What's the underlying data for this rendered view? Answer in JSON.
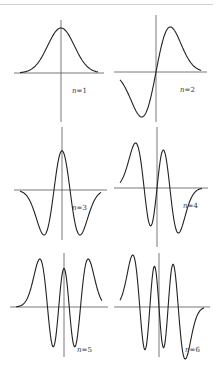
{
  "figure": {
    "stroke_color": "#222222",
    "axis_color": "#555555"
  },
  "chart_data": [
    {
      "type": "line",
      "label": "n = 1",
      "n": 1,
      "nodes": 0,
      "parity": "even",
      "panel": "top-left"
    },
    {
      "type": "line",
      "label": "n = 2",
      "n": 2,
      "nodes": 1,
      "parity": "odd",
      "panel": "top-right"
    },
    {
      "type": "line",
      "label": "n = 3",
      "n": 3,
      "nodes": 2,
      "parity": "even",
      "panel": "middle-left"
    },
    {
      "type": "line",
      "label": "n = 4",
      "n": 4,
      "nodes": 3,
      "parity": "odd",
      "panel": "middle-right"
    },
    {
      "type": "line",
      "label": "n = 5",
      "n": 5,
      "nodes": 4,
      "parity": "even",
      "panel": "bottom-left"
    },
    {
      "type": "line",
      "label": "n = 6",
      "n": 6,
      "nodes": 5,
      "parity": "odd",
      "panel": "bottom-right"
    }
  ],
  "labels": {
    "n_var": "n",
    "p1": "=1",
    "p2": "=2",
    "p3": "=3",
    "p4": "=4",
    "p5": "=5",
    "p6": "=6"
  }
}
